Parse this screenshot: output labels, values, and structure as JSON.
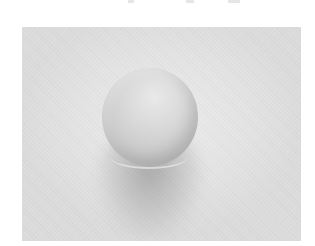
{
  "image": {
    "description": "Grayscale photograph of a single round ball resting on a light textured surface, casting a soft shadow beneath it",
    "colors": {
      "background": "#ffffff",
      "surface": "#e4e4e4",
      "ball_highlight": "#e9e9e9",
      "ball_shade": "#b5b5b5",
      "shadow": "#8c8c8c"
    }
  }
}
